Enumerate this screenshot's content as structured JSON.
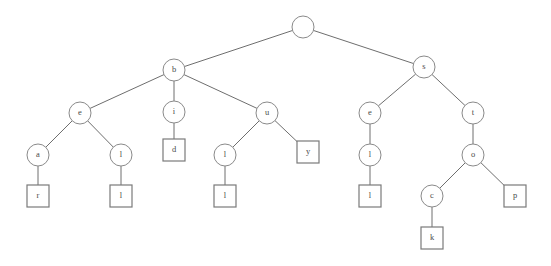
{
  "diagram": {
    "type": "tree",
    "canvas": {
      "width": 551,
      "height": 266,
      "background": "#ffffff"
    },
    "style": {
      "edge_color": "#6e6e6e",
      "circle_stroke": "#8a8a8a",
      "circle_fill": "#ffffff",
      "square_stroke": "#7a7a7a",
      "square_fill": "#ffffff",
      "label_color": "#4a4a4a"
    },
    "nodes": [
      {
        "id": "root",
        "label": "",
        "shape": "circle",
        "x": 303,
        "y": 27,
        "r": 11
      },
      {
        "id": "b",
        "label": "b",
        "shape": "circle",
        "x": 174,
        "y": 70,
        "r": 11
      },
      {
        "id": "s",
        "label": "s",
        "shape": "circle",
        "x": 424,
        "y": 67,
        "r": 11
      },
      {
        "id": "e1",
        "label": "e",
        "shape": "circle",
        "x": 80,
        "y": 113,
        "r": 11
      },
      {
        "id": "i",
        "label": "i",
        "shape": "circle",
        "x": 174,
        "y": 112,
        "r": 11
      },
      {
        "id": "u",
        "label": "u",
        "shape": "circle",
        "x": 267,
        "y": 113,
        "r": 11
      },
      {
        "id": "e2",
        "label": "e",
        "shape": "circle",
        "x": 370,
        "y": 113,
        "r": 11
      },
      {
        "id": "t",
        "label": "t",
        "shape": "circle",
        "x": 473,
        "y": 113,
        "r": 11
      },
      {
        "id": "a",
        "label": "a",
        "shape": "circle",
        "x": 38,
        "y": 155,
        "r": 11
      },
      {
        "id": "l1",
        "label": "l",
        "shape": "circle",
        "x": 121,
        "y": 155,
        "r": 11
      },
      {
        "id": "l2",
        "label": "l",
        "shape": "circle",
        "x": 225,
        "y": 155,
        "r": 11
      },
      {
        "id": "l3",
        "label": "l",
        "shape": "circle",
        "x": 370,
        "y": 155,
        "r": 11
      },
      {
        "id": "o",
        "label": "o",
        "shape": "circle",
        "x": 473,
        "y": 155,
        "r": 11
      },
      {
        "id": "c",
        "label": "c",
        "shape": "circle",
        "x": 432,
        "y": 196,
        "r": 11
      },
      {
        "id": "d_sq",
        "label": "d",
        "shape": "square",
        "x": 174,
        "y": 150,
        "size": 22
      },
      {
        "id": "y_sq",
        "label": "y",
        "shape": "square",
        "x": 308,
        "y": 152,
        "size": 22
      },
      {
        "id": "p_sq",
        "label": "p",
        "shape": "square",
        "x": 515,
        "y": 196,
        "size": 22
      },
      {
        "id": "r_sq",
        "label": "r",
        "shape": "square",
        "x": 38,
        "y": 196,
        "size": 22
      },
      {
        "id": "l1_sq",
        "label": "l",
        "shape": "square",
        "x": 121,
        "y": 196,
        "size": 22
      },
      {
        "id": "l2_sq",
        "label": "l",
        "shape": "square",
        "x": 225,
        "y": 196,
        "size": 22
      },
      {
        "id": "l3_sq",
        "label": "l",
        "shape": "square",
        "x": 370,
        "y": 196,
        "size": 22
      },
      {
        "id": "k_sq",
        "label": "k",
        "shape": "square",
        "x": 432,
        "y": 238,
        "size": 22
      }
    ],
    "edges": [
      {
        "from": "root",
        "to": "b"
      },
      {
        "from": "root",
        "to": "s"
      },
      {
        "from": "b",
        "to": "e1"
      },
      {
        "from": "b",
        "to": "i"
      },
      {
        "from": "b",
        "to": "u"
      },
      {
        "from": "s",
        "to": "e2"
      },
      {
        "from": "s",
        "to": "t"
      },
      {
        "from": "e1",
        "to": "a"
      },
      {
        "from": "e1",
        "to": "l1"
      },
      {
        "from": "i",
        "to": "d_sq"
      },
      {
        "from": "u",
        "to": "l2"
      },
      {
        "from": "u",
        "to": "y_sq"
      },
      {
        "from": "e2",
        "to": "l3"
      },
      {
        "from": "t",
        "to": "o"
      },
      {
        "from": "a",
        "to": "r_sq"
      },
      {
        "from": "l1",
        "to": "l1_sq"
      },
      {
        "from": "l2",
        "to": "l2_sq"
      },
      {
        "from": "l3",
        "to": "l3_sq"
      },
      {
        "from": "o",
        "to": "c"
      },
      {
        "from": "o",
        "to": "p_sq"
      },
      {
        "from": "c",
        "to": "k_sq"
      }
    ]
  }
}
